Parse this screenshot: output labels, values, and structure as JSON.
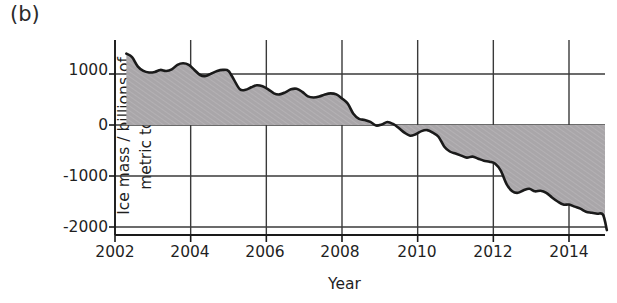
{
  "panel": {
    "label": "(b)"
  },
  "chart_data": {
    "type": "area",
    "title": "",
    "subtitle": "",
    "xlabel": "Year",
    "ylabel": "Ice mass / billions of metric tonnes",
    "ylabel_line1": "Ice mass / billions of",
    "ylabel_line2": "metric tonnes",
    "xlim": [
      2002,
      2015.2
    ],
    "ylim": [
      -2250,
      1600
    ],
    "xticks": [
      2002,
      2004,
      2006,
      2008,
      2010,
      2012,
      2014
    ],
    "xtick_labels": [
      "2002",
      "2004",
      "2006",
      "2008",
      "2010",
      "2012",
      "2014"
    ],
    "yticks": [
      1000,
      0,
      -1000,
      -2000
    ],
    "ytick_labels": [
      "1000",
      "0",
      "-1000",
      "-2000"
    ],
    "grid": true,
    "grid_axes": "both",
    "legend": null,
    "baseline": 0,
    "fill_color": "#a9a6a9",
    "line_color": "#1a1a1a",
    "grid_color": "#3a3a3a",
    "axis_color": "#1a1a1a",
    "series": [
      {
        "name": "Greenland ice mass anomaly",
        "x": [
          2002.3,
          2002.45,
          2002.6,
          2002.75,
          2002.9,
          2003.05,
          2003.2,
          2003.35,
          2003.5,
          2003.65,
          2003.8,
          2003.95,
          2004.1,
          2004.25,
          2004.4,
          2004.55,
          2004.7,
          2004.85,
          2005.0,
          2005.15,
          2005.3,
          2005.45,
          2005.6,
          2005.75,
          2005.9,
          2006.05,
          2006.2,
          2006.35,
          2006.5,
          2006.65,
          2006.8,
          2006.95,
          2007.1,
          2007.25,
          2007.4,
          2007.55,
          2007.7,
          2007.85,
          2008.0,
          2008.15,
          2008.3,
          2008.45,
          2008.6,
          2008.75,
          2008.9,
          2009.05,
          2009.2,
          2009.35,
          2009.5,
          2009.65,
          2009.8,
          2009.95,
          2010.1,
          2010.25,
          2010.4,
          2010.55,
          2010.7,
          2010.85,
          2011.0,
          2011.15,
          2011.3,
          2011.45,
          2011.6,
          2011.75,
          2011.9,
          2012.05,
          2012.2,
          2012.35,
          2012.5,
          2012.65,
          2012.8,
          2012.95,
          2013.1,
          2013.25,
          2013.4,
          2013.55,
          2013.7,
          2013.85,
          2014.0,
          2014.15,
          2014.3,
          2014.45,
          2014.6,
          2014.75,
          2014.9,
          2015.0
        ],
        "y": [
          1400,
          1330,
          1150,
          1060,
          1030,
          1040,
          1080,
          1060,
          1090,
          1180,
          1210,
          1180,
          1080,
          980,
          960,
          1010,
          1060,
          1080,
          1060,
          880,
          700,
          690,
          740,
          780,
          760,
          700,
          620,
          600,
          640,
          700,
          710,
          650,
          560,
          540,
          560,
          600,
          620,
          600,
          520,
          420,
          220,
          120,
          100,
          60,
          -10,
          10,
          60,
          20,
          -60,
          -150,
          -210,
          -180,
          -120,
          -100,
          -150,
          -230,
          -420,
          -520,
          -560,
          -600,
          -640,
          -620,
          -660,
          -700,
          -720,
          -760,
          -900,
          -1160,
          -1300,
          -1330,
          -1280,
          -1250,
          -1300,
          -1290,
          -1330,
          -1420,
          -1500,
          -1560,
          -1560,
          -1600,
          -1640,
          -1700,
          -1720,
          -1740,
          -1760,
          -2060
        ]
      }
    ]
  }
}
